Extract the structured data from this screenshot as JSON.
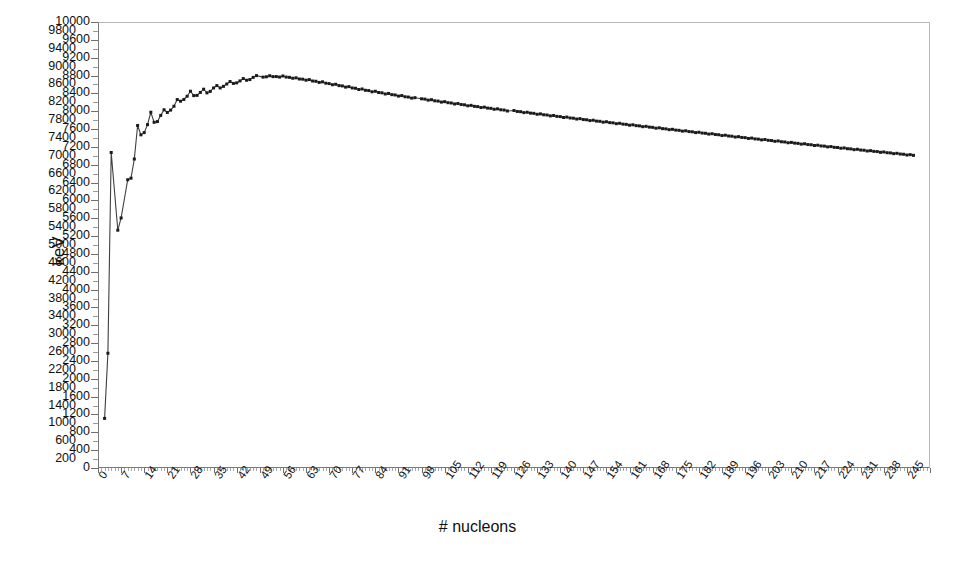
{
  "chart": {
    "title": "",
    "ylabel": "keV",
    "xlabel": "# nucleons",
    "series_name": "binding energy per nucleon"
  },
  "chart_data": {
    "type": "line",
    "title": "",
    "xlabel": "# nucleons",
    "ylabel": "keV",
    "xlim": [
      0,
      252
    ],
    "ylim": [
      0,
      10000
    ],
    "grid": false,
    "legend": "none",
    "marker": "square",
    "marker_color": "#1a1a1a",
    "line_color": "#3a3a3a",
    "xticks": [
      0,
      7,
      14,
      21,
      28,
      35,
      42,
      49,
      56,
      63,
      70,
      77,
      84,
      91,
      98,
      105,
      112,
      119,
      126,
      133,
      140,
      147,
      154,
      161,
      168,
      175,
      182,
      189,
      196,
      203,
      210,
      217,
      224,
      231,
      238,
      245
    ],
    "ytick_step": 200,
    "yticks": [
      0,
      200,
      400,
      600,
      800,
      1000,
      1200,
      1400,
      1600,
      1800,
      2000,
      2200,
      2400,
      2600,
      2800,
      3000,
      3200,
      3400,
      3600,
      3800,
      4000,
      4200,
      4400,
      4600,
      4800,
      5000,
      5200,
      5400,
      5600,
      5800,
      6000,
      6200,
      6400,
      6600,
      6800,
      7000,
      7200,
      7400,
      7600,
      7800,
      8000,
      8200,
      8400,
      8600,
      8800,
      9000,
      9200,
      9400,
      9600,
      9800,
      10000
    ],
    "x": [
      2,
      3,
      4,
      6,
      7,
      9,
      10,
      11,
      12,
      13,
      14,
      15,
      16,
      17,
      18,
      19,
      20,
      21,
      22,
      23,
      24,
      25,
      26,
      27,
      28,
      29,
      30,
      31,
      32,
      33,
      34,
      35,
      36,
      37,
      38,
      39,
      40,
      41,
      42,
      43,
      44,
      45,
      46,
      47,
      48,
      50,
      51,
      52,
      53,
      54,
      55,
      56,
      57,
      58,
      59,
      60,
      61,
      62,
      63,
      64,
      65,
      66,
      67,
      68,
      69,
      70,
      71,
      72,
      73,
      74,
      75,
      76,
      77,
      78,
      79,
      80,
      81,
      82,
      83,
      84,
      85,
      86,
      87,
      88,
      89,
      90,
      91,
      92,
      93,
      94,
      95,
      96,
      98,
      99,
      100,
      101,
      102,
      103,
      104,
      105,
      106,
      107,
      108,
      109,
      110,
      111,
      112,
      113,
      114,
      115,
      116,
      117,
      118,
      119,
      120,
      121,
      122,
      123,
      124,
      126,
      127,
      128,
      129,
      130,
      131,
      132,
      133,
      134,
      135,
      136,
      137,
      138,
      139,
      140,
      141,
      142,
      143,
      144,
      145,
      146,
      147,
      148,
      149,
      150,
      151,
      152,
      153,
      154,
      155,
      156,
      157,
      158,
      159,
      160,
      161,
      162,
      163,
      164,
      165,
      166,
      167,
      168,
      169,
      170,
      171,
      172,
      173,
      174,
      175,
      176,
      177,
      178,
      179,
      180,
      181,
      182,
      183,
      184,
      185,
      186,
      187,
      188,
      189,
      190,
      191,
      192,
      193,
      194,
      195,
      196,
      197,
      198,
      199,
      200,
      201,
      202,
      203,
      204,
      205,
      206,
      207,
      208,
      209,
      210,
      211,
      212,
      213,
      214,
      215,
      216,
      217,
      218,
      219,
      220,
      221,
      222,
      223,
      224,
      225,
      226,
      227,
      228,
      229,
      230,
      231,
      232,
      233,
      234,
      235,
      236,
      237,
      238,
      239,
      240,
      241,
      242,
      243,
      244,
      245,
      246,
      247
    ],
    "y": [
      1112,
      2573,
      7074,
      5332,
      5606,
      6463,
      6498,
      6928,
      7680,
      7470,
      7520,
      7699,
      7976,
      7751,
      7767,
      7906,
      8032,
      7972,
      8025,
      8111,
      8261,
      8224,
      8263,
      8336,
      8448,
      8349,
      8355,
      8421,
      8493,
      8411,
      8444,
      8521,
      8575,
      8521,
      8557,
      8610,
      8665,
      8623,
      8635,
      8679,
      8732,
      8694,
      8709,
      8758,
      8798,
      8764,
      8772,
      8795,
      8775,
      8777,
      8765,
      8790,
      8765,
      8759,
      8739,
      8748,
      8722,
      8718,
      8696,
      8708,
      8677,
      8671,
      8645,
      8658,
      8628,
      8619,
      8594,
      8604,
      8574,
      8567,
      8540,
      8551,
      8521,
      8514,
      8486,
      8498,
      8469,
      8462,
      8435,
      8447,
      8419,
      8412,
      8386,
      8398,
      8371,
      8364,
      8339,
      8350,
      8324,
      8317,
      8293,
      8303,
      8278,
      8271,
      8248,
      8258,
      8233,
      8227,
      8204,
      8214,
      8191,
      8184,
      8162,
      8172,
      8149,
      8143,
      8121,
      8131,
      8109,
      8103,
      8082,
      8091,
      8070,
      8064,
      8043,
      8053,
      8032,
      8026,
      8005,
      8015,
      7994,
      7989,
      7968,
      7977,
      7957,
      7952,
      7931,
      7940,
      7920,
      7915,
      7895,
      7904,
      7884,
      7879,
      7859,
      7868,
      7848,
      7843,
      7824,
      7833,
      7813,
      7808,
      7789,
      7798,
      7778,
      7773,
      7754,
      7763,
      7744,
      7739,
      7720,
      7729,
      7710,
      7705,
      7686,
      7695,
      7676,
      7671,
      7653,
      7661,
      7643,
      7638,
      7619,
      7628,
      7609,
      7604,
      7586,
      7594,
      7576,
      7571,
      7553,
      7561,
      7543,
      7538,
      7520,
      7528,
      7510,
      7505,
      7487,
      7495,
      7477,
      7472,
      7454,
      7462,
      7444,
      7439,
      7421,
      7429,
      7412,
      7407,
      7389,
      7397,
      7379,
      7374,
      7357,
      7365,
      7347,
      7342,
      7325,
      7333,
      7315,
      7310,
      7293,
      7301,
      7284,
      7279,
      7262,
      7270,
      7252,
      7248,
      7231,
      7238,
      7221,
      7217,
      7200,
      7207,
      7190,
      7186,
      7169,
      7176,
      7159,
      7155,
      7138,
      7146,
      7129,
      7125,
      7108,
      7115,
      7099,
      7095,
      7078,
      7086,
      7069,
      7065,
      7048,
      7056,
      7039,
      7035,
      7018,
      7026,
      7010,
      7006
    ]
  },
  "yaxis": {
    "labels": [
      "0",
      "200",
      "400",
      "600",
      "800",
      "1000",
      "1200",
      "1400",
      "1600",
      "1800",
      "2000",
      "2200",
      "2400",
      "2600",
      "2800",
      "3000",
      "3200",
      "3400",
      "3600",
      "3800",
      "4000",
      "4200",
      "4400",
      "4600",
      "4800",
      "5000",
      "5200",
      "5400",
      "5600",
      "5800",
      "6000",
      "6200",
      "6400",
      "6600",
      "6800",
      "7000",
      "7200",
      "7400",
      "7600",
      "7800",
      "8000",
      "8200",
      "8400",
      "8600",
      "8800",
      "9000",
      "9200",
      "9400",
      "9600",
      "9800",
      "10000"
    ]
  },
  "xaxis": {
    "labels": [
      "0",
      "7",
      "14",
      "21",
      "28",
      "35",
      "42",
      "49",
      "56",
      "63",
      "70",
      "77",
      "84",
      "91",
      "98",
      "105",
      "112",
      "119",
      "126",
      "133",
      "140",
      "147",
      "154",
      "161",
      "168",
      "175",
      "182",
      "189",
      "196",
      "203",
      "210",
      "217",
      "224",
      "231",
      "238",
      "245"
    ]
  }
}
